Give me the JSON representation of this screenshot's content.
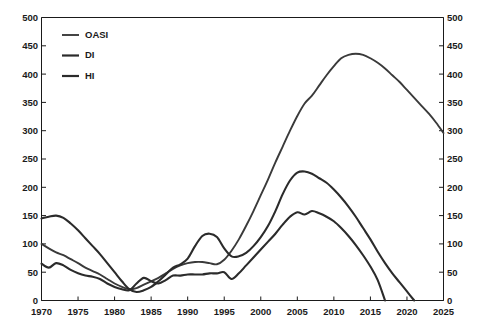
{
  "chart_data": {
    "type": "line",
    "title": "",
    "subtitle": "",
    "xlabel": "",
    "ylabel": "",
    "xlim": [
      1970,
      2025
    ],
    "ylim": [
      0,
      500
    ],
    "grid": false,
    "legend_position": "top-left",
    "dual_y_axis": true,
    "y_ticks": [
      0,
      50,
      100,
      150,
      200,
      250,
      300,
      350,
      400,
      450,
      500
    ],
    "y_tick_labels": [
      "0",
      "50",
      "100",
      "150",
      "200",
      "250",
      "300",
      "350",
      "400",
      "450",
      "500"
    ],
    "y_ticks_right": [
      0,
      50,
      100,
      150,
      200,
      250,
      300,
      350,
      400,
      450,
      500
    ],
    "y_tick_labels_right": [
      "0",
      "50",
      "100",
      "150",
      "200",
      "250",
      "300",
      "350",
      "400",
      "450",
      "500"
    ],
    "x_ticks": [
      1970,
      1975,
      1980,
      1985,
      1990,
      1995,
      2000,
      2005,
      2010,
      2015,
      2020,
      2025
    ],
    "x_tick_labels": [
      "1970",
      "1975",
      "1980",
      "1985",
      "1990",
      "1995",
      "2000",
      "2005",
      "2010",
      "2015",
      "2020",
      "2025"
    ],
    "series": [
      {
        "name": "OASI",
        "color": "#3a3a3a",
        "width": 1.9,
        "x": [
          1970,
          1971,
          1972,
          1973,
          1974,
          1975,
          1976,
          1977,
          1978,
          1979,
          1980,
          1981,
          1982,
          1983,
          1984,
          1985,
          1986,
          1987,
          1988,
          1989,
          1990,
          1991,
          1992,
          1993,
          1994,
          1995,
          1996,
          1997,
          1998,
          1999,
          2000,
          2001,
          2002,
          2003,
          2004,
          2005,
          2006,
          2007,
          2008,
          2009,
          2010,
          2011,
          2012,
          2013,
          2014,
          2015,
          2016,
          2017,
          2018,
          2019,
          2020,
          2021,
          2022,
          2023,
          2024,
          2025
        ],
        "y": [
          100,
          92,
          85,
          80,
          73,
          66,
          58,
          52,
          46,
          38,
          30,
          24,
          20,
          22,
          28,
          34,
          40,
          48,
          56,
          62,
          66,
          68,
          68,
          66,
          64,
          72,
          88,
          108,
          132,
          158,
          186,
          214,
          244,
          272,
          300,
          326,
          348,
          362,
          380,
          398,
          414,
          428,
          434,
          436,
          434,
          428,
          420,
          410,
          398,
          386,
          372,
          358,
          344,
          330,
          314,
          296
        ]
      },
      {
        "name": "DI",
        "color": "#2b2b2b",
        "width": 2.1,
        "x": [
          1970,
          1971,
          1972,
          1973,
          1974,
          1975,
          1976,
          1977,
          1978,
          1979,
          1980,
          1981,
          1982,
          1983,
          1984,
          1985,
          1986,
          1987,
          1988,
          1989,
          1990,
          1991,
          1992,
          1993,
          1994,
          1995,
          1996,
          1997,
          1998,
          1999,
          2000,
          2001,
          2002,
          2003,
          2004,
          2005,
          2006,
          2007,
          2008,
          2009,
          2010,
          2011,
          2012,
          2013,
          2014,
          2015,
          2016,
          2017,
          2018,
          2019,
          2020,
          2021
        ],
        "y": [
          145,
          148,
          150,
          146,
          136,
          124,
          110,
          96,
          82,
          66,
          50,
          34,
          20,
          15,
          18,
          24,
          34,
          46,
          58,
          64,
          74,
          96,
          114,
          118,
          112,
          92,
          78,
          78,
          84,
          96,
          112,
          132,
          158,
          188,
          212,
          226,
          228,
          224,
          216,
          208,
          196,
          182,
          166,
          148,
          128,
          108,
          86,
          66,
          48,
          32,
          16,
          0
        ]
      },
      {
        "name": "HI",
        "color": "#2b2b2b",
        "width": 2.1,
        "x": [
          1970,
          1971,
          1972,
          1973,
          1974,
          1975,
          1976,
          1977,
          1978,
          1979,
          1980,
          1981,
          1982,
          1983,
          1984,
          1985,
          1986,
          1987,
          1988,
          1989,
          1990,
          1991,
          1992,
          1993,
          1994,
          1995,
          1996,
          1997,
          1998,
          1999,
          2000,
          2001,
          2002,
          2003,
          2004,
          2005,
          2006,
          2007,
          2008,
          2009,
          2010,
          2011,
          2012,
          2013,
          2014,
          2015,
          2016,
          2017
        ],
        "y": [
          65,
          58,
          66,
          62,
          54,
          48,
          44,
          42,
          38,
          30,
          24,
          20,
          18,
          30,
          40,
          34,
          30,
          36,
          44,
          44,
          46,
          46,
          46,
          48,
          48,
          50,
          38,
          48,
          62,
          76,
          90,
          104,
          118,
          134,
          148,
          156,
          152,
          158,
          154,
          148,
          140,
          128,
          114,
          98,
          80,
          60,
          36,
          0
        ]
      }
    ],
    "legend": [
      {
        "label": "OASI",
        "color": "#3a3a3a"
      },
      {
        "label": "DI",
        "color": "#2b2b2b"
      },
      {
        "label": "HI",
        "color": "#2b2b2b"
      }
    ]
  }
}
